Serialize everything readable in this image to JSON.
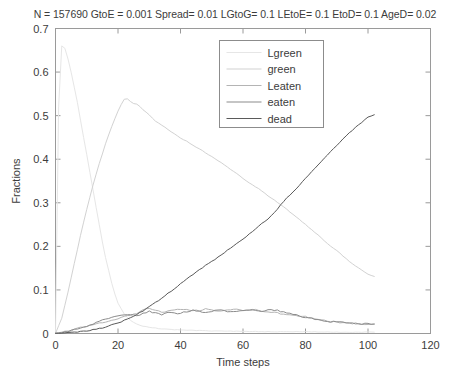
{
  "figure": {
    "param_title": "N = 157690  GtoE = 0.001  Spread= 0.01  LGtoG= 0.1  LEtoE= 0.1  EtoD= 0.1  AgeD= 0.02",
    "background": "#ffffff",
    "axis_color": "#9a9a9a",
    "text_color": "#3c3c3c"
  },
  "chart_data": {
    "type": "line",
    "title": "N = 157690  GtoE = 0.001  Spread= 0.01  LGtoG= 0.1  LEtoE= 0.1  EtoD= 0.1  AgeD= 0.02",
    "xlabel": "Time steps",
    "ylabel": "Fractions",
    "xlim": [
      0,
      120
    ],
    "ylim": [
      0,
      0.7
    ],
    "xticks": [
      0,
      20,
      40,
      60,
      80,
      100,
      120
    ],
    "xtick_labels": [
      "0",
      "20",
      "40",
      "60",
      "80",
      "100",
      "120"
    ],
    "yticks": [
      0,
      0.1,
      0.2,
      0.3,
      0.4,
      0.5,
      0.6,
      0.7
    ],
    "ytick_labels": [
      "0",
      "0.1",
      "0.2",
      "0.3",
      "0.4",
      "0.5",
      "0.6",
      "0.7"
    ],
    "grid": false,
    "legend_position": "top-center-right",
    "series": [
      {
        "name": "Lgreen",
        "color": "#e6e6e6",
        "x": [
          0,
          1,
          2,
          3,
          4,
          5,
          6,
          7,
          8,
          9,
          10,
          11,
          12,
          13,
          14,
          15,
          16,
          17,
          18,
          19,
          20,
          22,
          24,
          26,
          28,
          30,
          35,
          40,
          50,
          60,
          70,
          80,
          90,
          100,
          102
        ],
        "y": [
          0.0,
          0.52,
          0.66,
          0.655,
          0.63,
          0.6,
          0.565,
          0.53,
          0.49,
          0.45,
          0.41,
          0.37,
          0.33,
          0.29,
          0.25,
          0.21,
          0.175,
          0.145,
          0.115,
          0.09,
          0.07,
          0.045,
          0.03,
          0.022,
          0.017,
          0.014,
          0.01,
          0.008,
          0.006,
          0.005,
          0.004,
          0.004,
          0.003,
          0.003,
          0.003
        ]
      },
      {
        "name": "green",
        "color": "#d2d2d2",
        "x": [
          0,
          2,
          4,
          6,
          8,
          10,
          12,
          14,
          16,
          18,
          20,
          21,
          22,
          23,
          24,
          25,
          26,
          27,
          28,
          30,
          32,
          34,
          36,
          38,
          40,
          42,
          44,
          46,
          48,
          50,
          52,
          54,
          56,
          58,
          60,
          62,
          64,
          66,
          68,
          70,
          72,
          74,
          76,
          78,
          80,
          82,
          84,
          86,
          88,
          90,
          92,
          94,
          96,
          98,
          100,
          102
        ],
        "y": [
          0.0,
          0.035,
          0.095,
          0.16,
          0.225,
          0.285,
          0.34,
          0.39,
          0.435,
          0.475,
          0.51,
          0.525,
          0.537,
          0.538,
          0.533,
          0.528,
          0.527,
          0.521,
          0.513,
          0.502,
          0.487,
          0.478,
          0.468,
          0.459,
          0.449,
          0.441,
          0.432,
          0.424,
          0.415,
          0.406,
          0.397,
          0.387,
          0.377,
          0.367,
          0.356,
          0.346,
          0.337,
          0.327,
          0.316,
          0.306,
          0.296,
          0.285,
          0.273,
          0.262,
          0.25,
          0.238,
          0.226,
          0.213,
          0.201,
          0.19,
          0.178,
          0.166,
          0.155,
          0.145,
          0.136,
          0.131
        ]
      },
      {
        "name": "Leaten",
        "color": "#b4b4b4",
        "x": [
          0,
          3,
          6,
          9,
          12,
          15,
          18,
          20,
          22,
          24,
          26,
          28,
          30,
          32,
          34,
          36,
          38,
          40,
          42,
          44,
          46,
          48,
          50,
          52,
          54,
          56,
          58,
          60,
          62,
          64,
          66,
          68,
          70,
          72,
          74,
          76,
          78,
          80,
          82,
          84,
          86,
          88,
          90,
          92,
          94,
          96,
          98,
          100,
          102
        ],
        "y": [
          0.0,
          0.004,
          0.009,
          0.015,
          0.02,
          0.026,
          0.031,
          0.034,
          0.038,
          0.042,
          0.047,
          0.054,
          0.058,
          0.054,
          0.049,
          0.052,
          0.055,
          0.056,
          0.055,
          0.054,
          0.053,
          0.056,
          0.054,
          0.05,
          0.052,
          0.055,
          0.056,
          0.054,
          0.053,
          0.054,
          0.052,
          0.05,
          0.048,
          0.046,
          0.044,
          0.042,
          0.04,
          0.038,
          0.035,
          0.032,
          0.03,
          0.028,
          0.026,
          0.025,
          0.024,
          0.023,
          0.022,
          0.021,
          0.021
        ]
      },
      {
        "name": "eaten",
        "color": "#8c8c8c",
        "x": [
          0,
          3,
          6,
          9,
          12,
          15,
          18,
          20,
          22,
          24,
          26,
          28,
          30,
          32,
          34,
          36,
          38,
          40,
          42,
          44,
          46,
          48,
          50,
          52,
          54,
          56,
          58,
          60,
          62,
          64,
          66,
          68,
          70,
          72,
          74,
          76,
          78,
          80,
          82,
          84,
          86,
          88,
          90,
          92,
          94,
          96,
          98,
          100,
          102
        ],
        "y": [
          0.0,
          0.003,
          0.008,
          0.014,
          0.022,
          0.03,
          0.037,
          0.041,
          0.043,
          0.044,
          0.041,
          0.045,
          0.051,
          0.047,
          0.044,
          0.048,
          0.047,
          0.046,
          0.05,
          0.053,
          0.05,
          0.047,
          0.05,
          0.054,
          0.053,
          0.049,
          0.051,
          0.053,
          0.055,
          0.053,
          0.051,
          0.053,
          0.054,
          0.051,
          0.048,
          0.044,
          0.04,
          0.036,
          0.034,
          0.031,
          0.029,
          0.027,
          0.026,
          0.025,
          0.024,
          0.023,
          0.022,
          0.022,
          0.022
        ]
      },
      {
        "name": "dead",
        "color": "#5a5a5a",
        "x": [
          0,
          5,
          10,
          15,
          20,
          24,
          28,
          32,
          36,
          40,
          44,
          48,
          52,
          56,
          60,
          64,
          66,
          68,
          70,
          72,
          74,
          76,
          78,
          80,
          82,
          84,
          86,
          88,
          90,
          92,
          94,
          96,
          98,
          100,
          102
        ],
        "y": [
          0.0,
          0.002,
          0.006,
          0.013,
          0.024,
          0.036,
          0.052,
          0.071,
          0.092,
          0.114,
          0.136,
          0.156,
          0.175,
          0.196,
          0.216,
          0.24,
          0.252,
          0.262,
          0.277,
          0.295,
          0.311,
          0.325,
          0.34,
          0.356,
          0.372,
          0.387,
          0.402,
          0.418,
          0.432,
          0.447,
          0.46,
          0.473,
          0.485,
          0.496,
          0.502
        ]
      }
    ]
  },
  "legend": {
    "entries": [
      {
        "label": "Lgreen",
        "color": "#e6e6e6"
      },
      {
        "label": "green",
        "color": "#d2d2d2"
      },
      {
        "label": "Leaten",
        "color": "#b4b4b4"
      },
      {
        "label": "eaten",
        "color": "#8c8c8c"
      },
      {
        "label": "dead",
        "color": "#5a5a5a"
      }
    ]
  }
}
